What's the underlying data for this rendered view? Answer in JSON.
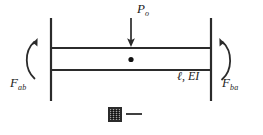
{
  "figure": {
    "background_color": "#ffffff",
    "line_color": "#2b2b2b"
  },
  "labels": {
    "load": {
      "symbol": "P",
      "subscript": "o",
      "full": "Pₒ"
    },
    "moment_left": {
      "symbol": "F",
      "subscript": "ab",
      "full": "Fₐᵦ"
    },
    "moment_right": {
      "symbol": "F",
      "subscript": "ba",
      "full": "Fᵦₐ"
    },
    "beam_properties": {
      "full": "ℓ, EI",
      "length_symbol": "ℓ",
      "stiffness_symbol": "EI"
    }
  },
  "elements": {
    "left_wall": "left-fixed-support",
    "right_wall": "right-fixed-support",
    "beam": "horizontal-beam-member",
    "midpoint": "beam-midspan-marker",
    "load_arrow": "downward-point-load-arrow",
    "left_moment_arrow": "left-end-moment-curved-arrow",
    "right_moment_arrow": "right-end-moment-curved-arrow",
    "artifact": "small-scanned-glyph-artifact"
  }
}
